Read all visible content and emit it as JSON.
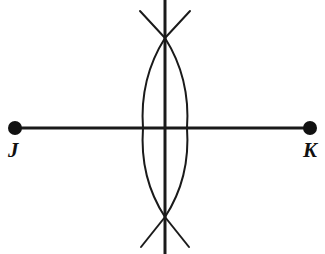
{
  "figure": {
    "background_color": "#ffffff",
    "stroke_color": "#1a1a1a",
    "width": 325,
    "height": 254
  },
  "labels": {
    "left_point": "J",
    "right_point": "K"
  },
  "geometry": {
    "segment": {
      "name": "segment-jk",
      "x1": 15,
      "y1": 128,
      "x2": 310,
      "y2": 128,
      "stroke_width": 3
    },
    "endpoints": [
      {
        "name": "point-j",
        "cx": 15,
        "cy": 128,
        "r": 7
      },
      {
        "name": "point-k",
        "cx": 310,
        "cy": 128,
        "r": 7
      }
    ],
    "midpoint": {
      "x": 165,
      "y": 128
    },
    "arc_intersections": [
      {
        "name": "upper-intersection",
        "x": 165,
        "y": 38
      },
      {
        "name": "lower-intersection",
        "x": 165,
        "y": 217
      }
    ],
    "arc_left": {
      "name": "arc-from-j",
      "start_x": 165,
      "start_y": 38,
      "end_x": 165,
      "end_y": 217,
      "extreme_x": 143,
      "extreme_y": 128,
      "stroke_width": 2
    },
    "arc_right": {
      "name": "arc-from-k",
      "start_x": 165,
      "start_y": 38,
      "end_x": 165,
      "end_y": 217,
      "extreme_x": 187,
      "extreme_y": 128,
      "stroke_width": 2
    },
    "arc_tails": [
      {
        "name": "tail-top-left",
        "x1": 165,
        "y1": 38,
        "x2": 140,
        "y2": 11
      },
      {
        "name": "tail-top-right",
        "x1": 165,
        "y1": 38,
        "x2": 190,
        "y2": 11
      },
      {
        "name": "tail-bottom-left",
        "x1": 165,
        "y1": 217,
        "x2": 141,
        "y2": 247
      },
      {
        "name": "tail-bottom-right",
        "x1": 165,
        "y1": 217,
        "x2": 189,
        "y2": 247
      }
    ],
    "bisector_line": {
      "name": "perpendicular-bisector",
      "x1": 165,
      "y1": 0,
      "x2": 165,
      "y2": 254,
      "stroke_width": 3
    }
  }
}
